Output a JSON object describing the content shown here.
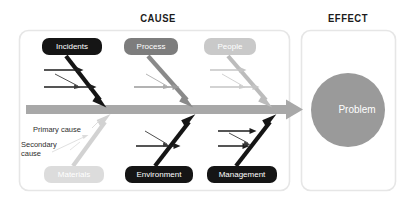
{
  "headers": {
    "cause": "CAUSE",
    "effect": "EFFECT"
  },
  "effect": {
    "problem_label": "Problem",
    "problem_color": "#9a9a9a"
  },
  "spine": {
    "color": "#a8a8a8",
    "direction": "right"
  },
  "legend": {
    "primary_cause": "Primary cause",
    "secondary_cause": "Secondary\ncause"
  },
  "categories": [
    {
      "id": "incidents",
      "label": "Incidents",
      "position": "top",
      "box_color": "#151515",
      "text_color": "#ffffff",
      "bone_color": "#151515",
      "secondary_count": 2,
      "tertiary_count": 1
    },
    {
      "id": "process",
      "label": "Process",
      "position": "top",
      "box_color": "#7d7d7d",
      "text_color": "#ffffff",
      "bone_color": "#8a8a8a",
      "secondary_count": 1,
      "tertiary_count": 1
    },
    {
      "id": "people",
      "label": "People",
      "position": "top",
      "box_color": "#c9c9c9",
      "text_color": "#ffffff",
      "bone_color": "#bcbcbc",
      "secondary_count": 2,
      "tertiary_count": 1
    },
    {
      "id": "materials",
      "label": "Materials",
      "position": "bottom",
      "box_color": "#dcdcdc",
      "text_color": "#ffffff",
      "bone_color": "#d2d2d2",
      "secondary_count": 0,
      "tertiary_count": 1
    },
    {
      "id": "environment",
      "label": "Environment",
      "position": "bottom",
      "box_color": "#151515",
      "text_color": "#ffffff",
      "bone_color": "#151515",
      "secondary_count": 1,
      "tertiary_count": 1
    },
    {
      "id": "management",
      "label": "Management",
      "position": "bottom",
      "box_color": "#151515",
      "text_color": "#ffffff",
      "bone_color": "#151515",
      "secondary_count": 2,
      "tertiary_count": 1
    }
  ],
  "panels": {
    "cause_border": "#e4e4e4",
    "effect_border": "#e4e4e4"
  }
}
